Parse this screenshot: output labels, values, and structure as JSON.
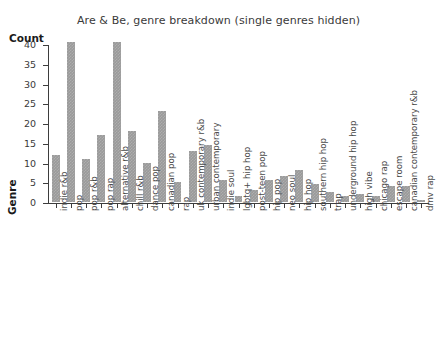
{
  "chart_data": {
    "type": "bar",
    "title": "Are & Be, genre breakdown (single genres hidden)",
    "xlabel": "Genre",
    "ylabel": "Count",
    "ylim": [
      0,
      40
    ],
    "ytick_labels": [
      "0",
      "5",
      "10",
      "15",
      "20",
      "25",
      "30",
      "35",
      "40"
    ],
    "ytick_values": [
      0,
      5,
      10,
      15,
      20,
      25,
      30,
      35,
      40
    ],
    "grid": false,
    "legend": "none",
    "bar_color": "#9a9a9a",
    "categories": [
      "indie r&b",
      "pop",
      "pop r&b",
      "pop rap",
      "alternative r&b",
      "chill r&b",
      "dance pop",
      "canadian pop",
      "rap",
      "uk contemporary r&b",
      "urban contemporary",
      "indie soul",
      "lgbtq+ hip hop",
      "post-teen pop",
      "hip pop",
      "neo soul",
      "hip hop",
      "southern hip hop",
      "trap",
      "underground hip hop",
      "high vibe",
      "chicago rap",
      "escape room",
      "canadian contemporary r&b",
      "dmv rap"
    ],
    "values": [
      12,
      40.5,
      11,
      17,
      40.5,
      18,
      10,
      23,
      5,
      13,
      14.5,
      5.5,
      1.5,
      3,
      5.5,
      6.5,
      8,
      4.5,
      2.5,
      1.5,
      2,
      1.5,
      4,
      4,
      0.5
    ]
  }
}
